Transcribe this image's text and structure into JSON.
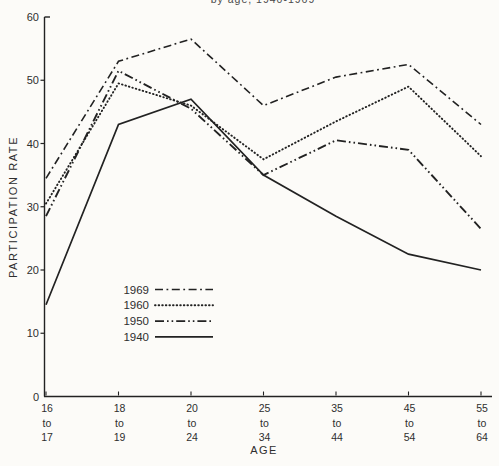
{
  "chart_data": {
    "type": "line",
    "title": "by age, 1940-1969",
    "xlabel": "AGE",
    "ylabel": "PARTICIPATION RATE",
    "ylim": [
      0,
      60
    ],
    "yticks": [
      0,
      10,
      20,
      30,
      40,
      50,
      60
    ],
    "grid": false,
    "legend_position": "inside-lower-left",
    "line_color": "#222222",
    "categories": [
      "16 to 17",
      "18 to 19",
      "20 to 24",
      "25 to 34",
      "35 to 44",
      "45 to 54",
      "55 to 64"
    ],
    "series": [
      {
        "name": "1969",
        "style": "dash-dot",
        "values": [
          34.5,
          53,
          56.5,
          46,
          50.5,
          52.5,
          43
        ]
      },
      {
        "name": "1960",
        "style": "dotted",
        "values": [
          30.5,
          49.5,
          46,
          37.5,
          43.5,
          49,
          38
        ]
      },
      {
        "name": "1950",
        "style": "dash-dot-dot",
        "values": [
          28.5,
          51.5,
          45.5,
          35,
          40.5,
          39,
          26.5
        ]
      },
      {
        "name": "1940",
        "style": "solid",
        "values": [
          14.5,
          43,
          47,
          35,
          28.5,
          22.5,
          20
        ]
      }
    ]
  }
}
